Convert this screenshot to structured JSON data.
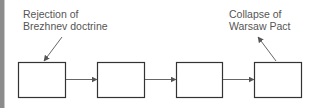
{
  "diagram": {
    "type": "flow-chain",
    "boxes": [
      {
        "id": "box-1",
        "text": ""
      },
      {
        "id": "box-2",
        "text": ""
      },
      {
        "id": "box-3",
        "text": ""
      },
      {
        "id": "box-4",
        "text": ""
      }
    ],
    "arrows": [
      {
        "from": "box-1",
        "to": "box-2"
      },
      {
        "from": "box-2",
        "to": "box-3"
      },
      {
        "from": "box-3",
        "to": "box-4"
      }
    ],
    "annotations": [
      {
        "target": "box-1",
        "line1": "Rejection of",
        "line2": "Brezhnev doctrine"
      },
      {
        "target": "box-4",
        "line1": "Collapse of",
        "line2": "Warsaw Pact"
      }
    ],
    "colors": {
      "box_stroke": "#333333",
      "arrow": "#555555",
      "text": "#555555",
      "side_bar": "#8c8c8c"
    }
  }
}
